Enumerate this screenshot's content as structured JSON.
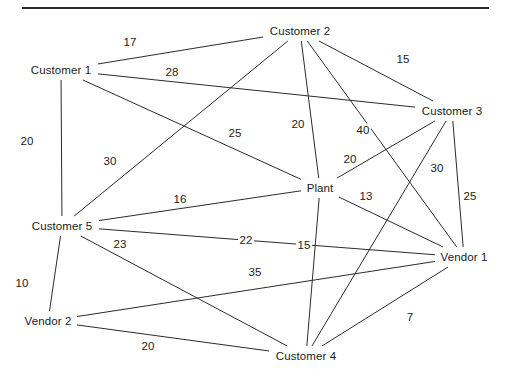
{
  "diagram": {
    "title": "",
    "type": "undirected-weighted-network",
    "stroke_color": "#2b2b2b",
    "text_color": "#1c1c1c",
    "background_color": "#ffffff",
    "top_rule": true,
    "nodes": [
      {
        "id": "customer1",
        "label": "Customer 1",
        "x": 61,
        "y": 70,
        "halfw": 34,
        "halfh": 7
      },
      {
        "id": "customer2",
        "label": "Customer 2",
        "x": 300,
        "y": 31,
        "halfw": 34,
        "halfh": 7
      },
      {
        "id": "customer3",
        "label": "Customer 3",
        "x": 452,
        "y": 111,
        "halfw": 34,
        "halfh": 7
      },
      {
        "id": "plant",
        "label": "Plant",
        "x": 320,
        "y": 188,
        "halfw": 16,
        "halfh": 7
      },
      {
        "id": "customer5",
        "label": "Customer 5",
        "x": 62,
        "y": 226,
        "halfw": 34,
        "halfh": 7
      },
      {
        "id": "vendor1",
        "label": "Vendor 1",
        "x": 464,
        "y": 257,
        "halfw": 26,
        "halfh": 7
      },
      {
        "id": "vendor2",
        "label": "Vendor 2",
        "x": 48,
        "y": 321,
        "halfw": 26,
        "halfh": 7
      },
      {
        "id": "customer4",
        "label": "Customer 4",
        "x": 306,
        "y": 356,
        "halfw": 34,
        "halfh": 7
      }
    ],
    "edges": [
      {
        "id": "e-c1-c2",
        "from": "customer1",
        "to": "customer2",
        "weight": "17",
        "lx": 130,
        "ly": 42
      },
      {
        "id": "e-c2-c3",
        "from": "customer2",
        "to": "customer3",
        "weight": "15",
        "lx": 403,
        "ly": 59
      },
      {
        "id": "e-c1-c3",
        "from": "customer1",
        "to": "customer3",
        "weight": "28",
        "lx": 172,
        "ly": 72
      },
      {
        "id": "e-c1-c5",
        "from": "customer1",
        "to": "customer5",
        "weight": "20",
        "lx": 27,
        "ly": 141
      },
      {
        "id": "e-c1-pl",
        "from": "customer1",
        "to": "plant",
        "weight": "25",
        "lx": 235,
        "ly": 133
      },
      {
        "id": "e-c2-pl",
        "from": "customer2",
        "to": "plant",
        "weight": "20",
        "lx": 298,
        "ly": 124
      },
      {
        "id": "e-c2-v1",
        "from": "customer2",
        "to": "vendor1",
        "weight": "40",
        "lx": 363,
        "ly": 130
      },
      {
        "id": "e-c2-c5",
        "from": "customer2",
        "to": "customer5",
        "weight": "30",
        "lx": 110,
        "ly": 161
      },
      {
        "id": "e-c3-pl",
        "from": "customer3",
        "to": "plant",
        "weight": "20",
        "lx": 350,
        "ly": 159
      },
      {
        "id": "e-c3-c4",
        "from": "customer3",
        "to": "customer4",
        "weight": "30",
        "lx": 437,
        "ly": 168
      },
      {
        "id": "e-c3-v1",
        "from": "customer3",
        "to": "vendor1",
        "weight": "25",
        "lx": 470,
        "ly": 196
      },
      {
        "id": "e-c5-pl",
        "from": "customer5",
        "to": "plant",
        "weight": "16",
        "lx": 180,
        "ly": 199
      },
      {
        "id": "e-pl-v1",
        "from": "plant",
        "to": "vendor1",
        "weight": "13",
        "lx": 366,
        "ly": 196
      },
      {
        "id": "e-c5-v1",
        "from": "customer5",
        "to": "vendor1",
        "weight": "22",
        "lx": 246,
        "ly": 240
      },
      {
        "id": "e-c5-c4",
        "from": "customer5",
        "to": "customer4",
        "weight": "23",
        "lx": 120,
        "ly": 244
      },
      {
        "id": "e-pl-c4",
        "from": "plant",
        "to": "customer4",
        "weight": "15",
        "lx": 304,
        "ly": 245
      },
      {
        "id": "e-v2-v1",
        "from": "vendor2",
        "to": "vendor1",
        "weight": "35",
        "lx": 255,
        "ly": 272
      },
      {
        "id": "e-c5-v2",
        "from": "customer5",
        "to": "vendor2",
        "weight": "10",
        "lx": 22,
        "ly": 283
      },
      {
        "id": "e-v1-c4",
        "from": "vendor1",
        "to": "customer4",
        "weight": "7",
        "lx": 410,
        "ly": 317
      },
      {
        "id": "e-v2-c4",
        "from": "vendor2",
        "to": "customer4",
        "weight": "20",
        "lx": 148,
        "ly": 346
      }
    ]
  }
}
